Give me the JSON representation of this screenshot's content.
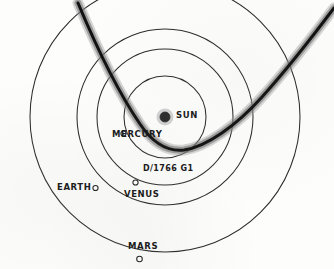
{
  "diagram": {
    "style": "hand-drawn pencil sketch",
    "background_color": "#fdfdfc",
    "ink_color": "#1c1c1c"
  },
  "sun": {
    "label": "SUN",
    "center_x": 165,
    "center_y": 117,
    "radius": 5.0,
    "color": "#2a2a2a",
    "label_x": 176,
    "label_y": 113
  },
  "orbits": [
    {
      "name": "mercury-orbit",
      "planet": "MERCURY",
      "radius": 41,
      "label_x": 112,
      "label_y": 134,
      "marker_x": 123.5,
      "marker_y": 133.5,
      "marker_radius": 2.6
    },
    {
      "name": "venus-orbit",
      "planet": "VENUS",
      "radius": 68,
      "label_x": 124,
      "label_y": 194,
      "marker_x": 135.5,
      "marker_y": 182.5,
      "marker_radius": 2.6
    },
    {
      "name": "earth-orbit",
      "planet": "EARTH",
      "radius": 88,
      "label_x": 57,
      "label_y": 186,
      "marker_x": 95.5,
      "marker_y": 188.0,
      "marker_radius": 2.6
    },
    {
      "name": "mars-orbit",
      "planet": "MARS",
      "radius": 135,
      "label_x": 128,
      "label_y": 245,
      "marker_x": 139.5,
      "marker_y": 259.0,
      "marker_radius": 2.8
    }
  ],
  "comet": {
    "designation": "D/1766 G1",
    "label_x": 143,
    "label_y": 168,
    "core_color": "#111111",
    "halo_color": "#8a8a8a",
    "entry_direction": "upper-left",
    "exit_direction": "upper-right",
    "perihelion_note": "inside Mercury orbit"
  }
}
